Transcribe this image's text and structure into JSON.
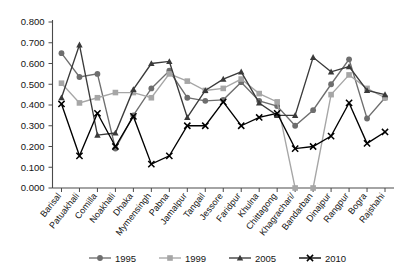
{
  "chart_data": {
    "type": "line",
    "title": "",
    "subtitle": "",
    "xlabel": "",
    "ylabel": "",
    "ylim": [
      0.0,
      0.8
    ],
    "ytick_labels": [
      "0.000",
      "0.100",
      "0.200",
      "0.300",
      "0.400",
      "0.500",
      "0.600",
      "0.700",
      "0.800"
    ],
    "ytick_values": [
      0.0,
      0.1,
      0.2,
      0.3,
      0.4,
      0.5,
      0.6,
      0.7,
      0.8
    ],
    "grid": false,
    "legend_position": "bottom",
    "categories": [
      "Barisal",
      "Patuakhali",
      "Comilla",
      "Noakhali",
      "Dhaka",
      "Mymensingh",
      "Pabna",
      "Jamalpur",
      "Tangail",
      "Jessore",
      "Faridpur",
      "Khulna",
      "Chittagong",
      "Khagrachari/",
      "Bandarban",
      "Dinajpur",
      "Rangpur",
      "Bogra",
      "Rajshahi"
    ],
    "series": [
      {
        "name": "1995",
        "color": "#6e6e6e",
        "marker": "circle",
        "values": [
          0.65,
          0.535,
          0.55,
          0.19,
          0.35,
          0.48,
          0.565,
          0.435,
          0.42,
          0.425,
          0.51,
          0.42,
          0.395,
          0.3,
          0.375,
          0.5,
          0.62,
          0.335,
          0.435
        ]
      },
      {
        "name": "1999",
        "color": "#a6a6a6",
        "marker": "square",
        "values": [
          0.505,
          0.41,
          0.435,
          0.46,
          0.46,
          0.435,
          0.55,
          0.515,
          0.47,
          0.48,
          0.525,
          0.455,
          0.415,
          0.0,
          0.0,
          0.45,
          0.545,
          0.48,
          0.435
        ]
      },
      {
        "name": "2005",
        "color": "#3a3a3a",
        "marker": "triangle",
        "values": [
          0.435,
          0.69,
          0.255,
          0.265,
          0.475,
          0.6,
          0.61,
          0.34,
          0.47,
          0.525,
          0.56,
          0.41,
          0.35,
          0.35,
          0.63,
          0.56,
          0.585,
          0.47,
          0.45
        ]
      },
      {
        "name": "2010",
        "color": "#000000",
        "marker": "x",
        "values": [
          0.405,
          0.155,
          0.36,
          0.2,
          0.345,
          0.115,
          0.155,
          0.3,
          0.3,
          0.415,
          0.3,
          0.34,
          0.36,
          0.19,
          0.2,
          0.25,
          0.41,
          0.215,
          0.27
        ]
      }
    ]
  },
  "legend": {
    "items": [
      {
        "label": "1995"
      },
      {
        "label": "1999"
      },
      {
        "label": "2005"
      },
      {
        "label": "2010"
      }
    ]
  }
}
